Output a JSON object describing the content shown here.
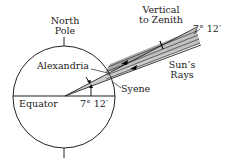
{
  "diagram": {
    "labels": {
      "north_pole_line1": "North",
      "north_pole_line2": "Pole",
      "vertical_line1": "Vertical",
      "vertical_line2": "to Zenith",
      "angle_top": "7° 12′",
      "alexandria": "Alexandria",
      "syene": "Syene",
      "suns_line1": "Sun’s",
      "suns_line2": "Rays",
      "equator": "Equator",
      "angle_center": "7° 12′"
    },
    "colors": {
      "line": "#2a2a2a",
      "wedge_fill": "#b8b8b8",
      "rays_fill": "#9a9a9a"
    }
  }
}
